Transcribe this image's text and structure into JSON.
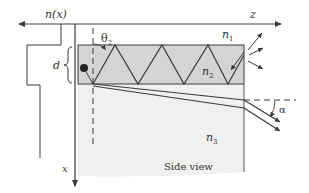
{
  "labels": {
    "n_profile": "n(x)",
    "z_axis": "z",
    "x_axis": "x",
    "theta": "θ",
    "theta_sub": "2",
    "d": "d",
    "n1": "n",
    "n1_sub": "1",
    "n2": "n",
    "n2_sub": "2",
    "n3": "n",
    "n3_sub": "3",
    "alpha": "α",
    "view": "Side view"
  },
  "colors": {
    "line": "#3a3a3a",
    "core_fill": "#d4d4d4",
    "substrate_fill": "#f0f0f0"
  }
}
